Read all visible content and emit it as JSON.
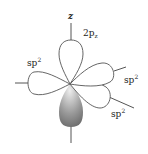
{
  "diagram": {
    "axis_label": "z",
    "p_orbital_label": "2p",
    "p_orbital_subscript": "z",
    "hybrid_labels": [
      {
        "base": "sp",
        "sup": "2",
        "position": "left"
      },
      {
        "base": "sp",
        "sup": "2",
        "position": "upper-right"
      },
      {
        "base": "sp",
        "sup": "2",
        "position": "lower-right"
      }
    ],
    "colors": {
      "outline": "#555555",
      "shade_dark": "#6e6e6e",
      "shade_light": "#e6e6e6",
      "text": "#222222"
    }
  }
}
